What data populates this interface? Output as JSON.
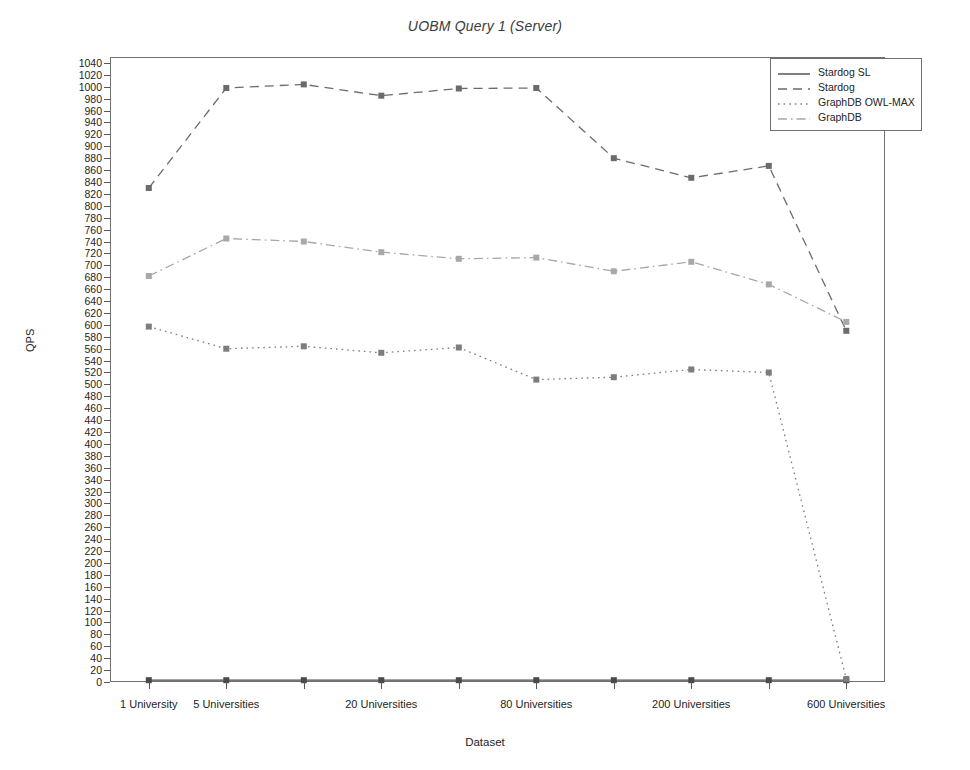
{
  "chart_data": {
    "type": "line",
    "title": "UOBM Query 1 (Server)",
    "xlabel": "Dataset",
    "ylabel": "QPS",
    "grid": false,
    "legend_position": "top-right",
    "ylim": [
      0,
      1050
    ],
    "ytick_step": 20,
    "yticks": [
      0,
      20,
      40,
      60,
      80,
      100,
      120,
      140,
      160,
      180,
      200,
      220,
      240,
      260,
      280,
      300,
      320,
      340,
      360,
      380,
      400,
      420,
      440,
      460,
      480,
      500,
      520,
      540,
      560,
      580,
      600,
      620,
      640,
      660,
      680,
      700,
      720,
      740,
      760,
      780,
      800,
      820,
      840,
      860,
      880,
      900,
      920,
      940,
      960,
      980,
      1000,
      1020,
      1040
    ],
    "categories": [
      "1 University",
      "5 Universities",
      "",
      "20 Universities",
      "",
      "80 Universities",
      "",
      "200 Universities",
      "",
      "600 Universities"
    ],
    "xtick_labels": [
      "1 University",
      "5 Universities",
      "20 Universities",
      "80 Universities",
      "200 Universities",
      "600 Universities"
    ],
    "xtick_label_indices": [
      0,
      1,
      3,
      5,
      7,
      9
    ],
    "series": [
      {
        "name": "Stardog SL",
        "style": "solid",
        "color": "#4a4a4a",
        "values": [
          3,
          3,
          3,
          3,
          3,
          3,
          3,
          3,
          3,
          3
        ]
      },
      {
        "name": "Stardog",
        "style": "dashed",
        "color": "#6b6b6b",
        "values": [
          830,
          998,
          1004,
          985,
          997,
          998,
          880,
          847,
          867,
          590
        ]
      },
      {
        "name": "GraphDB OWL-MAX",
        "style": "dotted",
        "color": "#7d7d7d",
        "values": [
          597,
          560,
          564,
          553,
          562,
          508,
          512,
          525,
          520,
          5
        ]
      },
      {
        "name": "GraphDB",
        "style": "dashdot",
        "color": "#a8a8a8",
        "values": [
          682,
          745,
          740,
          722,
          711,
          713,
          690,
          706,
          668,
          605
        ]
      }
    ]
  }
}
